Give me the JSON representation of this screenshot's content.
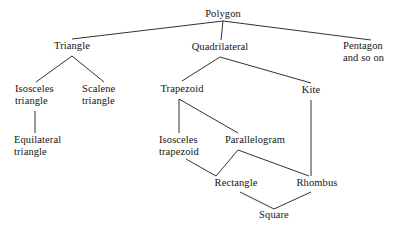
{
  "diagram": {
    "type": "tree",
    "background_color": "#ffffff",
    "line_color": "#1a1a1a",
    "text_color": "#141414",
    "nodes": [
      {
        "id": "polygon",
        "label": "Polygon",
        "x": 223,
        "y": 17,
        "anchor": "center"
      },
      {
        "id": "triangle",
        "label": "Triangle",
        "x": 72,
        "y": 49,
        "anchor": "center"
      },
      {
        "id": "quadrilateral",
        "label": "Quadrilateral",
        "x": 220,
        "y": 50,
        "anchor": "center"
      },
      {
        "id": "pentagon",
        "label": "Pentagon",
        "x": 343,
        "y": 49,
        "anchor": "start"
      },
      {
        "id": "and-so-on",
        "label": "and so on",
        "x": 343,
        "y": 61,
        "anchor": "start"
      },
      {
        "id": "isosceles",
        "label": "Isosceles",
        "x": 15,
        "y": 92,
        "anchor": "start"
      },
      {
        "id": "isosceles-2",
        "label": "triangle",
        "x": 15,
        "y": 104,
        "anchor": "start"
      },
      {
        "id": "scalene",
        "label": "Scalene",
        "x": 82,
        "y": 92,
        "anchor": "start"
      },
      {
        "id": "scalene-2",
        "label": "triangle",
        "x": 82,
        "y": 104,
        "anchor": "start"
      },
      {
        "id": "equilateral",
        "label": "Equilateral",
        "x": 14,
        "y": 143,
        "anchor": "start"
      },
      {
        "id": "equilateral-2",
        "label": "triangle",
        "x": 14,
        "y": 155,
        "anchor": "start"
      },
      {
        "id": "trapezoid",
        "label": "Trapezoid",
        "x": 182,
        "y": 92,
        "anchor": "center"
      },
      {
        "id": "kite",
        "label": "Kite",
        "x": 311,
        "y": 93,
        "anchor": "center"
      },
      {
        "id": "iso-trapezoid",
        "label": "Isosceles",
        "x": 159,
        "y": 143,
        "anchor": "start"
      },
      {
        "id": "iso-trapezoid-2",
        "label": "trapezoid",
        "x": 159,
        "y": 155,
        "anchor": "start"
      },
      {
        "id": "parallelogram",
        "label": "Parallelogram",
        "x": 255,
        "y": 143,
        "anchor": "center"
      },
      {
        "id": "rectangle",
        "label": "Rectangle",
        "x": 236,
        "y": 186,
        "anchor": "center"
      },
      {
        "id": "rhombus",
        "label": "Rhombus",
        "x": 317,
        "y": 186,
        "anchor": "center"
      },
      {
        "id": "square",
        "label": "Square",
        "x": 274,
        "y": 218,
        "anchor": "center"
      }
    ],
    "edges": [
      {
        "id": "polygon-triangle",
        "from": "Polygon",
        "to": "Triangle",
        "points": "223,21 72,39"
      },
      {
        "id": "polygon-quadrilateral",
        "from": "Polygon",
        "to": "Quadrilateral",
        "points": "223,21 221,40"
      },
      {
        "id": "polygon-pentagon",
        "from": "Polygon",
        "to": "Pentagon and so on",
        "points": "223,21 371,40"
      },
      {
        "id": "triangle-isosceles",
        "from": "Triangle",
        "to": "Isosceles triangle",
        "points": "72,56 36,82"
      },
      {
        "id": "triangle-scalene",
        "from": "Triangle",
        "to": "Scalene triangle",
        "points": "72,56 104,82"
      },
      {
        "id": "isosceles-equilateral",
        "from": "Isosceles triangle",
        "to": "Equilateral triangle",
        "points": "35,111 35,133"
      },
      {
        "id": "quadrilateral-trapezoid",
        "from": "Quadrilateral",
        "to": "Trapezoid",
        "points": "220,57 182,81"
      },
      {
        "id": "quadrilateral-kite",
        "from": "Quadrilateral",
        "to": "Kite",
        "points": "220,57 311,83"
      },
      {
        "id": "trapezoid-iso-trapezoid",
        "from": "Trapezoid",
        "to": "Isosceles trapezoid",
        "points": "179,99 179,133"
      },
      {
        "id": "trapezoid-parallelogram",
        "from": "Trapezoid",
        "to": "Parallelogram",
        "points": "179,99 238,133"
      },
      {
        "id": "kite-rhombus",
        "from": "Kite",
        "to": "Rhombus",
        "points": "311,100 311,176"
      },
      {
        "id": "iso-trapezoid-rectangle",
        "from": "Isosceles trapezoid",
        "to": "Rectangle",
        "points": "186,159 216,176"
      },
      {
        "id": "parallelogram-rectangle",
        "from": "Parallelogram",
        "to": "Rectangle",
        "points": "238,150 216,176"
      },
      {
        "id": "parallelogram-rhombus",
        "from": "Parallelogram",
        "to": "Rhombus",
        "points": "238,150 309,176"
      },
      {
        "id": "rectangle-square",
        "from": "Rectangle",
        "to": "Square",
        "points": "240,192 274,209"
      },
      {
        "id": "rhombus-square",
        "from": "Rhombus",
        "to": "Square",
        "points": "311,192 274,209"
      }
    ]
  }
}
